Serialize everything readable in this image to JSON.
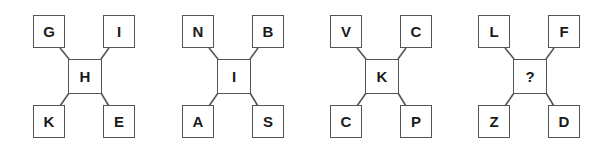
{
  "puzzle": {
    "type": "letter-cross-sequence",
    "figures": [
      {
        "top_left": "G",
        "top_right": "I",
        "center": "H",
        "bottom_left": "K",
        "bottom_right": "E"
      },
      {
        "top_left": "N",
        "top_right": "B",
        "center": "I",
        "bottom_left": "A",
        "bottom_right": "S"
      },
      {
        "top_left": "V",
        "top_right": "C",
        "center": "K",
        "bottom_left": "C",
        "bottom_right": "P"
      },
      {
        "top_left": "L",
        "top_right": "F",
        "center": "?",
        "bottom_left": "Z",
        "bottom_right": "D"
      }
    ]
  },
  "colors": {
    "stroke": "#555555",
    "text": "#1a1a1a",
    "background": "#ffffff"
  }
}
